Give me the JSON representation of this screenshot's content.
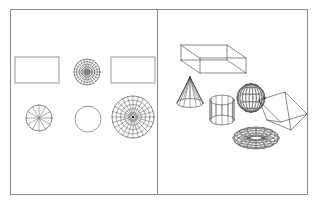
{
  "figure": {
    "background_color": "#ffffff",
    "frame": {
      "name": "outer-frame",
      "stroke_color": "#8c8c8c",
      "x": 10,
      "y": 9,
      "width": 297,
      "height": 185
    },
    "divider": {
      "name": "vertical-divider",
      "stroke_color": "#8c8c8c",
      "x": 157,
      "y_top": 9,
      "y_bottom": 194
    }
  },
  "panels": [
    {
      "id": "left-panel",
      "label": "2D primitives panel",
      "shapes": [
        {
          "id": "rectangle-top-left",
          "label": "Rectangle",
          "type": "rectangle",
          "cx": 37,
          "cy": 70,
          "width": 44,
          "height": 26,
          "stroke": "#6a6a6a"
        },
        {
          "id": "dense-polar-grid-top",
          "label": "Dense polar grid disc",
          "type": "polar-grid",
          "cx": 87,
          "cy": 72,
          "radius": 13,
          "rings": 5,
          "spokes": 24,
          "hub": true,
          "stroke": "#2b2b2b"
        },
        {
          "id": "rectangle-top-right",
          "label": "Rectangle",
          "type": "rectangle",
          "cx": 133,
          "cy": 70,
          "width": 44,
          "height": 26,
          "stroke": "#6a6a6a"
        },
        {
          "id": "spoked-wheel-bottom-left",
          "label": "Spoked wheel",
          "type": "polar-grid",
          "cx": 39,
          "cy": 118,
          "radius": 13,
          "rings": 1,
          "spokes": 12,
          "hub": true,
          "stroke": "#2b2b2b"
        },
        {
          "id": "plain-circle-bottom-center",
          "label": "Circle",
          "type": "circle",
          "cx": 88,
          "cy": 119,
          "radius": 13,
          "stroke": "#6a6a6a"
        },
        {
          "id": "large-polar-grid-bottom-right",
          "label": "Large polar grid disc",
          "type": "polar-grid",
          "cx": 133,
          "cy": 117,
          "radius": 21,
          "rings": 5,
          "spokes": 24,
          "hub": true,
          "stroke": "#2b2b2b"
        }
      ]
    },
    {
      "id": "right-panel",
      "label": "3D wireframe solids panel",
      "shapes": [
        {
          "id": "wireframe-box",
          "label": "Box",
          "type": "box",
          "cx": 223,
          "cy": 67,
          "stroke": "#2b2b2b"
        },
        {
          "id": "wireframe-cone",
          "label": "Cone",
          "type": "cone",
          "cx": 190,
          "cy": 90,
          "radius": 13,
          "height": 26,
          "segments": 12,
          "stroke": "#2b2b2b"
        },
        {
          "id": "wireframe-cylinder",
          "label": "Cylinder",
          "type": "cylinder",
          "cx": 222,
          "cy": 110,
          "radius": 12,
          "height": 20,
          "segments": 12,
          "stroke": "#2b2b2b"
        },
        {
          "id": "wireframe-sphere",
          "label": "Sphere",
          "type": "sphere",
          "cx": 251,
          "cy": 98,
          "radius": 14,
          "meridians": 12,
          "parallels": 6,
          "stroke": "#2b2b2b"
        },
        {
          "id": "wireframe-wedge",
          "label": "Wedge",
          "type": "wedge",
          "cx": 283,
          "cy": 112,
          "stroke": "#2b2b2b"
        },
        {
          "id": "wireframe-torus",
          "label": "Torus",
          "type": "torus",
          "cx": 256,
          "cy": 138,
          "outer_radius": 23,
          "tube_radius": 8,
          "meridians": 16,
          "parallels": 12,
          "stroke": "#2b2b2b"
        }
      ]
    }
  ]
}
